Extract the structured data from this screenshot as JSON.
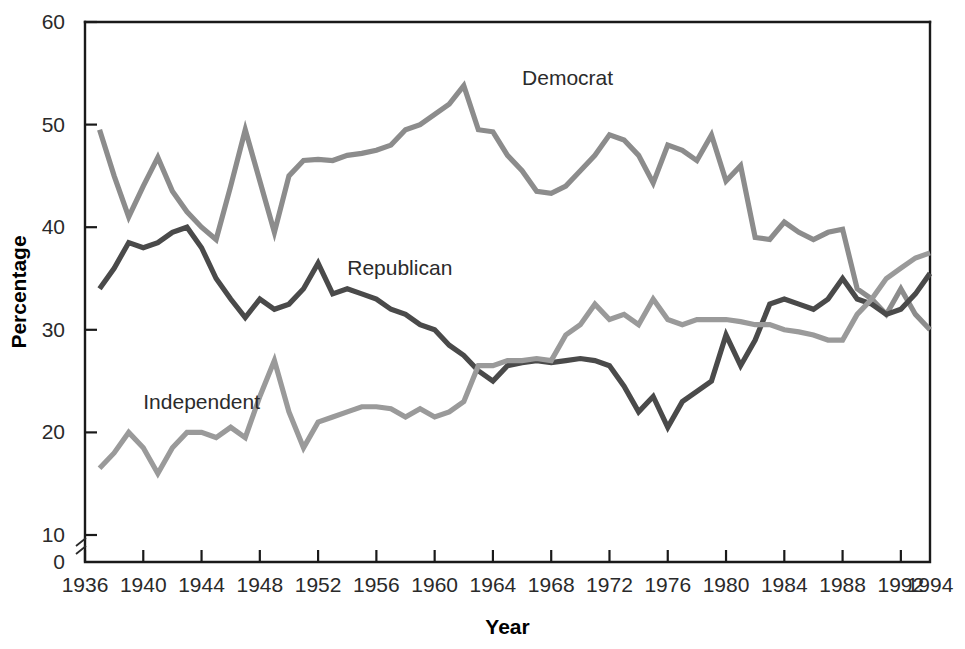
{
  "chart_data": {
    "type": "line",
    "title": "",
    "subtitle": "",
    "xlabel": "Year",
    "ylabel": "Percentage",
    "xlim": [
      1936,
      1994
    ],
    "ylim": [
      0,
      60
    ],
    "y_axis_break": true,
    "y_break_between": [
      0,
      10
    ],
    "grid": false,
    "legend_position": "inline-annotations",
    "xticks": [
      1936,
      1940,
      1944,
      1948,
      1952,
      1956,
      1960,
      1964,
      1968,
      1972,
      1976,
      1980,
      1984,
      1988,
      1992,
      1994
    ],
    "xtick_labels": [
      "1936",
      "1940",
      "1944",
      "1948",
      "1952",
      "1956",
      "1960",
      "1964",
      "1968",
      "1972",
      "1976",
      "1980",
      "1984",
      "1988",
      "1992",
      "1994"
    ],
    "yticks": [
      0,
      10,
      20,
      30,
      40,
      50,
      60
    ],
    "ytick_labels": [
      "0",
      "10",
      "20",
      "30",
      "40",
      "50",
      "60"
    ],
    "x": [
      1937,
      1938,
      1939,
      1940,
      1941,
      1942,
      1943,
      1944,
      1945,
      1946,
      1947,
      1948,
      1949,
      1950,
      1951,
      1952,
      1953,
      1954,
      1955,
      1956,
      1957,
      1958,
      1959,
      1960,
      1961,
      1962,
      1963,
      1964,
      1965,
      1966,
      1967,
      1968,
      1969,
      1970,
      1971,
      1972,
      1973,
      1974,
      1975,
      1976,
      1977,
      1978,
      1979,
      1980,
      1981,
      1982,
      1983,
      1984,
      1985,
      1986,
      1987,
      1988,
      1989,
      1990,
      1991,
      1992,
      1993,
      1994
    ],
    "series": [
      {
        "name": "Democrat",
        "color": "#8c8c8c",
        "values": [
          49.5,
          45.0,
          41.0,
          44.0,
          46.8,
          43.5,
          41.5,
          40.0,
          38.8,
          44.0,
          49.5,
          44.5,
          39.5,
          45.0,
          46.5,
          46.6,
          46.5,
          47.0,
          47.2,
          47.5,
          48.0,
          49.5,
          50.0,
          51.0,
          52.0,
          53.8,
          49.5,
          49.3,
          47.0,
          45.5,
          43.5,
          43.3,
          44.0,
          45.5,
          47.0,
          49.0,
          48.5,
          47.0,
          44.3,
          48.0,
          47.5,
          46.5,
          49.0,
          44.5,
          46.0,
          39.0,
          38.8,
          40.5,
          39.5,
          38.8,
          39.5,
          39.8,
          34.0,
          33.0,
          31.5,
          34.0,
          31.5,
          30.0
        ]
      },
      {
        "name": "Republican",
        "color": "#4a4a4a",
        "values": [
          34.0,
          36.0,
          38.5,
          38.0,
          38.5,
          39.5,
          40.0,
          38.0,
          35.0,
          33.0,
          31.2,
          33.0,
          32.0,
          32.5,
          34.0,
          36.5,
          33.5,
          34.0,
          33.5,
          33.0,
          32.0,
          31.5,
          30.5,
          30.0,
          28.5,
          27.5,
          26.0,
          25.0,
          26.5,
          26.8,
          27.0,
          26.8,
          27.0,
          27.2,
          27.0,
          26.5,
          24.5,
          22.0,
          23.5,
          20.5,
          23.0,
          24.0,
          25.0,
          29.5,
          26.5,
          29.0,
          32.5,
          33.0,
          32.5,
          32.0,
          33.0,
          35.0,
          33.0,
          32.5,
          31.5,
          32.0,
          33.5,
          35.5
        ]
      },
      {
        "name": "Independent",
        "color": "#9a9a9a",
        "values": [
          16.5,
          18.0,
          20.0,
          18.5,
          16.0,
          18.5,
          20.0,
          20.0,
          19.5,
          20.5,
          19.5,
          23.5,
          27.0,
          22.0,
          18.5,
          21.0,
          21.5,
          22.0,
          22.5,
          22.5,
          22.3,
          21.5,
          22.3,
          21.5,
          22.0,
          23.0,
          26.5,
          26.5,
          27.0,
          27.0,
          27.2,
          27.0,
          29.5,
          30.5,
          32.5,
          31.0,
          31.5,
          30.5,
          33.0,
          31.0,
          30.5,
          31.0,
          31.0,
          31.0,
          30.8,
          30.5,
          30.5,
          30.0,
          29.8,
          29.5,
          29.0,
          29.0,
          31.5,
          33.0,
          35.0,
          36.0,
          37.0,
          37.5
        ]
      }
    ],
    "annotations": [
      {
        "text": "Democrat",
        "x": 1966,
        "y": 54.5
      },
      {
        "text": "Republican",
        "x": 1954,
        "y": 36.0
      },
      {
        "text": "Independent",
        "x": 1940,
        "y": 23.0
      }
    ]
  }
}
